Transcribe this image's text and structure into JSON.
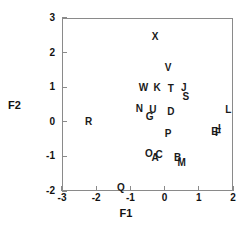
{
  "chart_data": {
    "type": "scatter",
    "title": "",
    "xlabel": "F1",
    "ylabel": "F2",
    "xlim": [
      -3,
      2
    ],
    "ylim": [
      -2,
      3
    ],
    "xticks": [
      -3,
      -2,
      -1,
      0,
      1,
      2
    ],
    "xticklabels": [
      "-3",
      "-2",
      "-1",
      "0",
      "1",
      "2"
    ],
    "yticks": [
      -2,
      -1,
      0,
      1,
      2,
      3
    ],
    "yticklabels": [
      "-2",
      "-1",
      "0",
      "1",
      "2",
      "3"
    ],
    "grid": false,
    "legend": null,
    "marker_style": "text-label",
    "points": [
      {
        "label": "X",
        "x": -0.28,
        "y": 2.45
      },
      {
        "label": "V",
        "x": 0.1,
        "y": 1.55
      },
      {
        "label": "W",
        "x": -0.62,
        "y": 0.97
      },
      {
        "label": "K",
        "x": -0.22,
        "y": 0.97
      },
      {
        "label": "T",
        "x": 0.18,
        "y": 0.95
      },
      {
        "label": "J",
        "x": 0.56,
        "y": 0.97
      },
      {
        "label": "S",
        "x": 0.62,
        "y": 0.72
      },
      {
        "label": "N",
        "x": -0.74,
        "y": 0.36
      },
      {
        "label": "U",
        "x": -0.34,
        "y": 0.33
      },
      {
        "label": "D",
        "x": 0.18,
        "y": 0.27
      },
      {
        "label": "L",
        "x": 1.86,
        "y": 0.33
      },
      {
        "label": "G",
        "x": -0.44,
        "y": 0.13
      },
      {
        "label": "R",
        "x": -2.22,
        "y": 0.0
      },
      {
        "label": "I",
        "x": 1.6,
        "y": -0.2
      },
      {
        "label": "E",
        "x": 1.46,
        "y": -0.3
      },
      {
        "label": "F",
        "x": 1.56,
        "y": -0.33
      },
      {
        "label": "P",
        "x": 0.1,
        "y": -0.36
      },
      {
        "label": "O",
        "x": -0.46,
        "y": -0.93
      },
      {
        "label": "C",
        "x": -0.16,
        "y": -0.95
      },
      {
        "label": "A",
        "x": -0.28,
        "y": -1.06
      },
      {
        "label": "B",
        "x": 0.38,
        "y": -1.06
      },
      {
        "label": "M",
        "x": 0.5,
        "y": -1.18
      },
      {
        "label": "Q",
        "x": -1.28,
        "y": -1.9
      }
    ]
  }
}
